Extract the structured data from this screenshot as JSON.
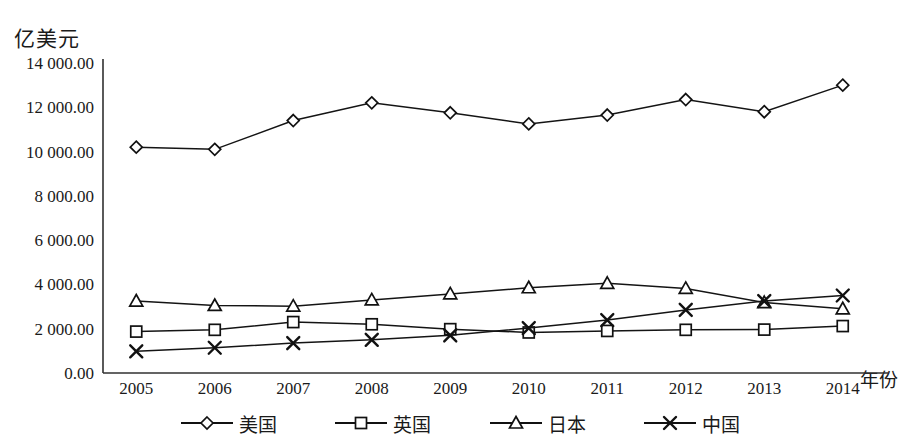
{
  "chart_data": {
    "type": "line",
    "title": "",
    "xlabel": "年份",
    "ylabel": "亿美元",
    "x": [
      "2005",
      "2006",
      "2007",
      "2008",
      "2009",
      "2010",
      "2011",
      "2012",
      "2013",
      "2014"
    ],
    "categories": [
      "2005",
      "2006",
      "2007",
      "2008",
      "2009",
      "2010",
      "2011",
      "2012",
      "2013",
      "2014"
    ],
    "ylim": [
      0,
      14000
    ],
    "yticks": [
      0,
      2000,
      4000,
      6000,
      8000,
      10000,
      12000,
      14000
    ],
    "ytick_labels": [
      "0.00",
      "2 000.00",
      "4 000.00",
      "6 000.00",
      "8 000.00",
      "10 000.00",
      "12 000.00",
      "14 000.00"
    ],
    "grid": false,
    "legend_position": "bottom",
    "series": [
      {
        "name": "美国",
        "marker": "diamond",
        "color": "#141414",
        "values": [
          10200,
          10100,
          11400,
          12200,
          11750,
          11250,
          11650,
          12350,
          11800,
          13000
        ]
      },
      {
        "name": "英国",
        "marker": "square",
        "color": "#141414",
        "values": [
          1870,
          1950,
          2300,
          2200,
          1980,
          1830,
          1900,
          1950,
          1960,
          2120
        ]
      },
      {
        "name": "日本",
        "marker": "triangle",
        "color": "#141414",
        "values": [
          3250,
          3050,
          3020,
          3300,
          3570,
          3850,
          4050,
          3820,
          3180,
          2900
        ]
      },
      {
        "name": "中国",
        "marker": "cross",
        "color": "#141414",
        "values": [
          980,
          1140,
          1350,
          1500,
          1700,
          2030,
          2390,
          2850,
          3250,
          3500
        ]
      }
    ]
  },
  "axis": {
    "y_title": "亿美元",
    "x_title": "年份"
  },
  "legend": {
    "items": [
      {
        "label": "美国",
        "marker": "diamond"
      },
      {
        "label": "英国",
        "marker": "square"
      },
      {
        "label": "日本",
        "marker": "triangle"
      },
      {
        "label": "中国",
        "marker": "cross"
      }
    ]
  }
}
